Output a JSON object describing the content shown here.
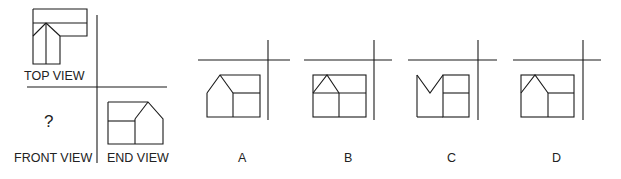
{
  "problem": {
    "question_mark": "?",
    "labels": {
      "top_view": "TOP VIEW",
      "front_view": "FRONT VIEW",
      "end_view": "END VIEW"
    }
  },
  "options": [
    {
      "label": "A"
    },
    {
      "label": "B"
    },
    {
      "label": "C"
    },
    {
      "label": "D"
    }
  ],
  "colors": {
    "line": "#1a1a1a",
    "text": "#222222",
    "background": "#ffffff"
  }
}
